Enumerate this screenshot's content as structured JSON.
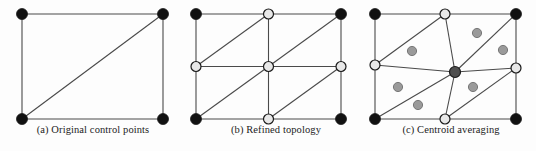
{
  "figure": {
    "width": 536,
    "height": 151,
    "background": "#fdfdfd",
    "panel_count": 3
  },
  "colors": {
    "line": "#4a4a4a",
    "border_line": "#555555",
    "node_black": "#111111",
    "node_light": "#e8e8e8",
    "node_gray_dark": "#4f4f4f",
    "centroid_gray": "#9a9a9a",
    "node_stroke": "#1a1a1a",
    "caption_text": "#1c1c1c"
  },
  "panels": [
    {
      "id": "a",
      "caption": "(a) Original control points",
      "rect": {
        "x0": 22,
        "y0": 14,
        "x1": 163,
        "y1": 119
      },
      "nodes": [
        {
          "name": "corner-top-left",
          "x": 22,
          "y": 14,
          "fill": "black",
          "r": 5.5
        },
        {
          "name": "corner-top-right",
          "x": 163,
          "y": 14,
          "fill": "black",
          "r": 5.5
        },
        {
          "name": "corner-bottom-left",
          "x": 22,
          "y": 119,
          "fill": "black",
          "r": 5.5
        },
        {
          "name": "corner-bottom-right",
          "x": 163,
          "y": 119,
          "fill": "black",
          "r": 5.5
        }
      ],
      "edges": [
        {
          "name": "edge-top",
          "x1": 22,
          "y1": 14,
          "x2": 163,
          "y2": 14
        },
        {
          "name": "edge-right",
          "x1": 163,
          "y1": 14,
          "x2": 163,
          "y2": 119
        },
        {
          "name": "edge-bottom",
          "x1": 22,
          "y1": 119,
          "x2": 163,
          "y2": 119
        },
        {
          "name": "edge-left",
          "x1": 22,
          "y1": 14,
          "x2": 22,
          "y2": 119
        },
        {
          "name": "edge-diagonal",
          "x1": 22,
          "y1": 119,
          "x2": 163,
          "y2": 14
        }
      ]
    },
    {
      "id": "b",
      "caption": "(b) Refined topology",
      "rect": {
        "x0": 196,
        "y0": 14,
        "x1": 341,
        "y1": 119
      },
      "nodes": [
        {
          "name": "corner-top-left",
          "x": 196,
          "y": 14,
          "fill": "black",
          "r": 5.5
        },
        {
          "name": "midpoint-top",
          "x": 268.5,
          "y": 14,
          "fill": "light",
          "r": 5.0
        },
        {
          "name": "corner-top-right",
          "x": 341,
          "y": 14,
          "fill": "black",
          "r": 5.5
        },
        {
          "name": "midpoint-left",
          "x": 196,
          "y": 66.5,
          "fill": "light",
          "r": 5.0
        },
        {
          "name": "center",
          "x": 268.5,
          "y": 66.5,
          "fill": "light",
          "r": 5.0
        },
        {
          "name": "midpoint-right",
          "x": 341,
          "y": 66.5,
          "fill": "light",
          "r": 5.0
        },
        {
          "name": "corner-bottom-left",
          "x": 196,
          "y": 119,
          "fill": "black",
          "r": 5.5
        },
        {
          "name": "midpoint-bottom",
          "x": 268.5,
          "y": 119,
          "fill": "light",
          "r": 5.0
        },
        {
          "name": "corner-bottom-right",
          "x": 341,
          "y": 119,
          "fill": "black",
          "r": 5.5
        }
      ],
      "edges": [
        {
          "name": "edge-top",
          "x1": 196,
          "y1": 14,
          "x2": 341,
          "y2": 14
        },
        {
          "name": "edge-bottom",
          "x1": 196,
          "y1": 119,
          "x2": 341,
          "y2": 119
        },
        {
          "name": "edge-left",
          "x1": 196,
          "y1": 14,
          "x2": 196,
          "y2": 119
        },
        {
          "name": "edge-right",
          "x1": 341,
          "y1": 14,
          "x2": 341,
          "y2": 119
        },
        {
          "name": "edge-horizontal-mid",
          "x1": 196,
          "y1": 66.5,
          "x2": 341,
          "y2": 66.5
        },
        {
          "name": "edge-vertical-mid",
          "x1": 268.5,
          "y1": 14,
          "x2": 268.5,
          "y2": 119
        },
        {
          "name": "diagonal-quadrant-top-left",
          "x1": 196,
          "y1": 66.5,
          "x2": 268.5,
          "y2": 14
        },
        {
          "name": "diagonal-quadrant-top-right",
          "x1": 268.5,
          "y1": 66.5,
          "x2": 341,
          "y2": 14
        },
        {
          "name": "diagonal-quadrant-bottom-left",
          "x1": 196,
          "y1": 119,
          "x2": 268.5,
          "y2": 66.5
        },
        {
          "name": "diagonal-quadrant-bottom-right",
          "x1": 268.5,
          "y1": 119,
          "x2": 341,
          "y2": 66.5
        }
      ]
    },
    {
      "id": "c",
      "caption": "(c) Centroid averaging",
      "rect": {
        "x0": 375,
        "y0": 14,
        "x1": 516,
        "y1": 119
      },
      "nodes": [
        {
          "name": "corner-top-left",
          "x": 375,
          "y": 14,
          "fill": "black",
          "r": 5.5
        },
        {
          "name": "midpoint-top",
          "x": 445,
          "y": 14,
          "fill": "light",
          "r": 5.0
        },
        {
          "name": "corner-top-right",
          "x": 516,
          "y": 14,
          "fill": "black",
          "r": 5.5
        },
        {
          "name": "midpoint-left",
          "x": 375,
          "y": 65,
          "fill": "light",
          "r": 5.0
        },
        {
          "name": "center-averaged",
          "x": 455,
          "y": 72,
          "fill": "gray-dark",
          "r": 5.5
        },
        {
          "name": "midpoint-right",
          "x": 516,
          "y": 68,
          "fill": "light",
          "r": 5.0
        },
        {
          "name": "corner-bottom-left",
          "x": 375,
          "y": 119,
          "fill": "black",
          "r": 5.5
        },
        {
          "name": "midpoint-bottom",
          "x": 445,
          "y": 119,
          "fill": "light",
          "r": 5.0
        },
        {
          "name": "corner-bottom-right",
          "x": 516,
          "y": 119,
          "fill": "black",
          "r": 5.5
        }
      ],
      "centroid_markers": [
        {
          "name": "centroid-marker-1",
          "x": 412,
          "y": 51,
          "r": 4.6
        },
        {
          "name": "centroid-marker-2",
          "x": 477,
          "y": 33,
          "r": 4.6
        },
        {
          "name": "centroid-marker-3",
          "x": 503,
          "y": 50,
          "r": 4.6
        },
        {
          "name": "centroid-marker-4",
          "x": 398,
          "y": 87,
          "r": 4.6
        },
        {
          "name": "centroid-marker-5",
          "x": 418,
          "y": 105,
          "r": 4.6
        },
        {
          "name": "centroid-marker-6",
          "x": 473,
          "y": 87,
          "r": 4.6
        }
      ],
      "edges": [
        {
          "name": "edge-top",
          "x1": 375,
          "y1": 14,
          "x2": 516,
          "y2": 14
        },
        {
          "name": "edge-bottom",
          "x1": 375,
          "y1": 119,
          "x2": 516,
          "y2": 119
        },
        {
          "name": "edge-left",
          "x1": 375,
          "y1": 14,
          "x2": 375,
          "y2": 119
        },
        {
          "name": "edge-right",
          "x1": 516,
          "y1": 14,
          "x2": 516,
          "y2": 119
        },
        {
          "name": "spoke-center-to-midpoint-top",
          "x1": 455,
          "y1": 72,
          "x2": 445,
          "y2": 14
        },
        {
          "name": "spoke-center-to-midpoint-left",
          "x1": 455,
          "y1": 72,
          "x2": 375,
          "y2": 65
        },
        {
          "name": "spoke-center-to-midpoint-right",
          "x1": 455,
          "y1": 72,
          "x2": 516,
          "y2": 68
        },
        {
          "name": "spoke-center-to-midpoint-bottom",
          "x1": 455,
          "y1": 72,
          "x2": 445,
          "y2": 119
        },
        {
          "name": "spoke-center-to-corner-top-right",
          "x1": 455,
          "y1": 72,
          "x2": 516,
          "y2": 14
        },
        {
          "name": "spoke-center-to-corner-bottom-left",
          "x1": 455,
          "y1": 72,
          "x2": 375,
          "y2": 119
        },
        {
          "name": "chord-midpoint-left-to-midpoint-top",
          "x1": 375,
          "y1": 65,
          "x2": 445,
          "y2": 14
        },
        {
          "name": "chord-midpoint-bottom-to-midpoint-right",
          "x1": 445,
          "y1": 119,
          "x2": 516,
          "y2": 68
        }
      ]
    }
  ]
}
